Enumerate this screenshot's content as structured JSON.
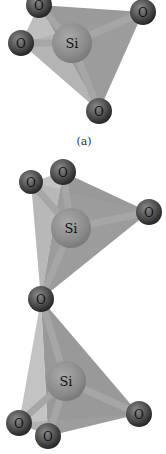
{
  "figure": {
    "panels": [
      {
        "id": "a",
        "caption": "(a)",
        "caption_pos": [
          84,
          141
        ],
        "silicon": {
          "label": "Si",
          "x": 72,
          "y": 43,
          "r": 20
        },
        "oxygens": [
          {
            "label": "O",
            "x": 39,
            "y": 5,
            "r": 13
          },
          {
            "label": "O",
            "x": 143,
            "y": 12,
            "r": 13
          },
          {
            "label": "O",
            "x": 21,
            "y": 43,
            "r": 13
          },
          {
            "label": "O",
            "x": 99,
            "y": 111,
            "r": 13
          }
        ]
      },
      {
        "id": "b",
        "caption": "",
        "silicons": [
          {
            "label": "Si",
            "x": 71,
            "y": 228,
            "r": 20
          },
          {
            "label": "Si",
            "x": 66,
            "y": 381,
            "r": 20
          }
        ],
        "oxygens": [
          {
            "label": "O",
            "x": 31,
            "y": 182,
            "r": 12
          },
          {
            "label": "O",
            "x": 63,
            "y": 172,
            "r": 13
          },
          {
            "label": "O",
            "x": 149,
            "y": 212,
            "r": 13
          },
          {
            "label": "O",
            "x": 41,
            "y": 299,
            "r": 13,
            "bridging": true
          },
          {
            "label": "O",
            "x": 19,
            "y": 423,
            "r": 13
          },
          {
            "label": "O",
            "x": 48,
            "y": 436,
            "r": 13
          },
          {
            "label": "O",
            "x": 139,
            "y": 414,
            "r": 13
          }
        ]
      }
    ],
    "colors": {
      "background": "#ffffff",
      "face_light": "#b9b9b9",
      "face_mid": "#9a9a9a",
      "face_dark": "#8a8a8a",
      "bond": "#a8a8a8",
      "silicon": "#8e8e8e",
      "oxygen": "#5a5a5a",
      "oxygen_dark": "#2e2e2e",
      "label": "#111111"
    }
  }
}
